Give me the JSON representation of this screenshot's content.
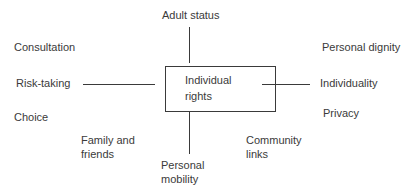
{
  "diagram": {
    "center": {
      "line1": "Individual",
      "line2": "rights"
    },
    "labels": {
      "adult_status": "Adult status",
      "consultation": "Consultation",
      "personal_dignity": "Personal dignity",
      "risk_taking": "Risk-taking",
      "individuality": "Individuality",
      "choice": "Choice",
      "privacy": "Privacy",
      "family_line1": "Family and",
      "family_line2": "friends",
      "community_line1": "Community",
      "community_line2": "links",
      "mobility_line1": "Personal",
      "mobility_line2": "mobility"
    },
    "colors": {
      "ink": "#3a3a3a",
      "background": "#ffffff"
    }
  }
}
